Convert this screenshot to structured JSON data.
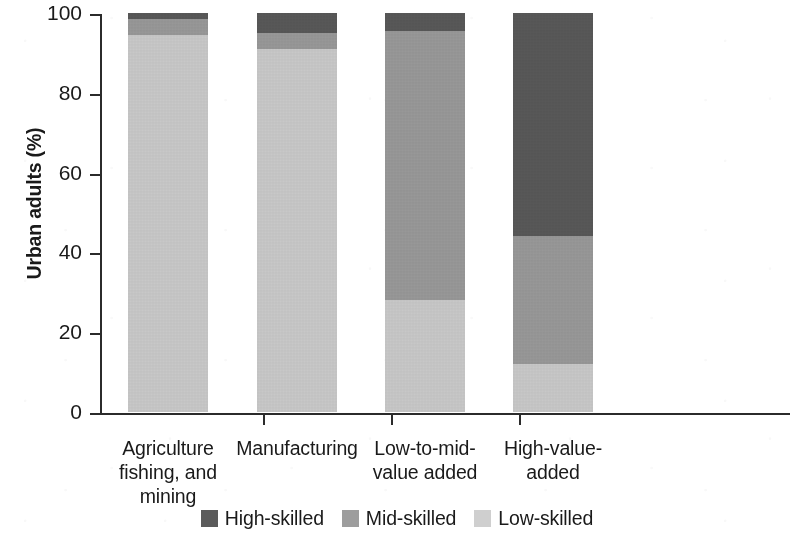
{
  "chart_data": {
    "type": "bar",
    "title": "",
    "subtitle": "",
    "xlabel": "",
    "ylabel": "Urban adults (%)",
    "ylim": [
      0,
      100
    ],
    "yticks": [
      0,
      20,
      40,
      60,
      80,
      100
    ],
    "ytick_labels": [
      "0",
      "20",
      "40",
      "60",
      "80",
      "100"
    ],
    "grid": false,
    "stacked": true,
    "stack_order_bottom_to_top": [
      "Low-skilled",
      "Mid-skilled",
      "High-skilled"
    ],
    "legend_position": "bottom-center",
    "categories": [
      "Agriculture fishing, and mining",
      "Manufacturing",
      "Low-to-mid-value added",
      "High-value-added"
    ],
    "category_label_lines": [
      [
        "Agriculture",
        "fishing, and",
        "mining"
      ],
      [
        "Manufacturing"
      ],
      [
        "Low-to-mid-",
        "value added"
      ],
      [
        "High-value-",
        "added"
      ]
    ],
    "series": [
      {
        "name": "High-skilled",
        "color": "#5b5b5b",
        "values": [
          1.5,
          5.0,
          4.5,
          56.0
        ]
      },
      {
        "name": "Mid-skilled",
        "color": "#9d9d9d",
        "values": [
          4.0,
          4.0,
          67.5,
          32.0
        ]
      },
      {
        "name": "Low-skilled",
        "color": "#cfcfcf",
        "values": [
          94.5,
          91.0,
          28.0,
          12.0
        ]
      }
    ]
  },
  "legend": {
    "items": [
      {
        "label": "High-skilled",
        "color": "#5b5b5b"
      },
      {
        "label": "Mid-skilled",
        "color": "#9d9d9d"
      },
      {
        "label": "Low-skilled",
        "color": "#cfcfcf"
      }
    ]
  },
  "axes": {
    "y_title": "Urban adults (%)",
    "y_tick_labels": [
      "100",
      "80",
      "60",
      "40",
      "20",
      "0"
    ]
  },
  "colors": {
    "high_skilled": "#5b5b5b",
    "mid_skilled": "#9d9d9d",
    "low_skilled": "#cfcfcf",
    "axis": "#2b2b2b",
    "text": "#1a1a1a",
    "background": "#ffffff"
  }
}
